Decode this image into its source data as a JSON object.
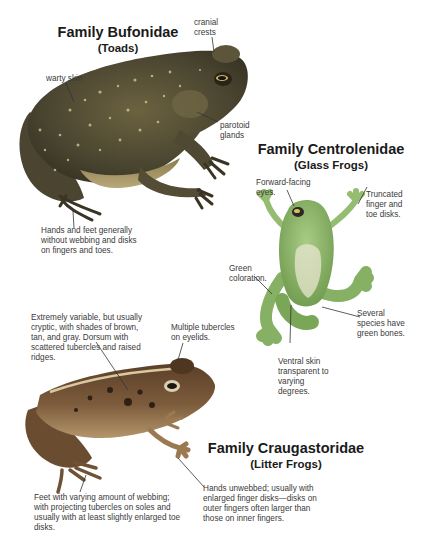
{
  "families": [
    {
      "id": "bufonidae",
      "title": "Family Bufonidae",
      "common_name": "(Toads)",
      "labels": {
        "cranial_crests": "cranial\ncrests",
        "warty_skin": "warty skin",
        "parotoid_glands": "parotoid\nglands",
        "hands_feet": "Hands and feet generally without webbing and disks on fingers and toes."
      }
    },
    {
      "id": "centrolenidae",
      "title": "Family Centrolenidae",
      "common_name": "(Glass Frogs)",
      "labels": {
        "eyes": "Forward-facing eyes.",
        "disks": "Truncated finger and toe disks.",
        "coloration": "Green coloration.",
        "bones": "Several species have green bones.",
        "ventral_skin": "Ventral skin transparent to varying degrees."
      }
    },
    {
      "id": "craugastoridae",
      "title": "Family Craugastoridae",
      "common_name": "(Litter Frogs)",
      "labels": {
        "dorsum": "Extremely variable, but usually cryptic, with shades of brown, tan, and gray. Dorsum with scattered tubercles and raised ridges.",
        "eyelids": "Multiple tubercles on eyelids.",
        "hands": "Hands unwebbed; usually with enlarged finger disks—disks on outer fingers often larger than those on inner fingers.",
        "feet": "Feet with varying amount of webbing; with projecting tubercles on soles and usually with at least slightly enlarged toe disks."
      }
    }
  ],
  "colors": {
    "toad_body": "#5a5236",
    "toad_spots": "#d8cf9a",
    "glass_frog": "#8fb86a",
    "glass_belly": "#e8e6d0",
    "litter_frog": "#7a5a3a",
    "litter_stripe": "#d9c9a0",
    "leader_line": "#333333",
    "title_text": "#1a1a1a"
  }
}
